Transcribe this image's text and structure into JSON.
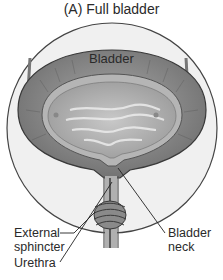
{
  "title": "(A) Full bladder",
  "labels": {
    "bladder": "Bladder",
    "external_sphincter_line1": "External",
    "external_sphincter_line2": "sphincter",
    "bladder_neck_line1": "Bladder",
    "bladder_neck_line2": "neck",
    "urethra": "Urethra"
  }
}
